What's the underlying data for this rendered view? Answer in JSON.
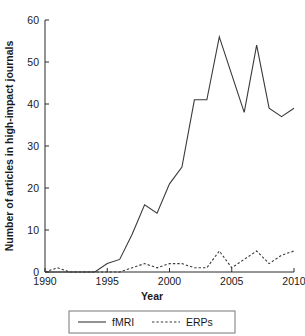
{
  "chart_data": {
    "type": "line",
    "title": "",
    "xlabel": "Year",
    "ylabel": "Number of articles in high-impact journals",
    "x": [
      1990,
      1991,
      1992,
      1993,
      1994,
      1995,
      1996,
      1997,
      1998,
      1999,
      2000,
      2001,
      2002,
      2003,
      2004,
      2005,
      2006,
      2007,
      2008,
      2009,
      2010
    ],
    "xlim": [
      1990,
      2010
    ],
    "ylim": [
      0,
      60
    ],
    "xticks": [
      1990,
      1995,
      2000,
      2005,
      2010
    ],
    "yticks": [
      0,
      10,
      20,
      30,
      40,
      50,
      60
    ],
    "xtick_labels": [
      "1990",
      "1995",
      "2000",
      "2005",
      "2010"
    ],
    "ytick_labels": [
      "0",
      "10",
      "20",
      "30",
      "40",
      "50",
      "60"
    ],
    "grid": false,
    "legend_position": "below",
    "series": [
      {
        "name": "fMRI",
        "style": "solid",
        "color": "#3a3a3a",
        "values": [
          0,
          0,
          0,
          0,
          0,
          2,
          3,
          9,
          16,
          14,
          21,
          25,
          41,
          41,
          56,
          47,
          38,
          54,
          39,
          37,
          39
        ]
      },
      {
        "name": "ERPs",
        "style": "dashed",
        "color": "#3a3a3a",
        "values": [
          0,
          1,
          0,
          0,
          0,
          0,
          0,
          1,
          2,
          1,
          2,
          2,
          1,
          1,
          5,
          1,
          3,
          5,
          2,
          4,
          5
        ]
      }
    ]
  },
  "axes": {
    "x_title": "Year",
    "y_title": "Number of articles in high-impact journals"
  },
  "legend": {
    "items": [
      {
        "label": "fMRI",
        "style": "solid"
      },
      {
        "label": "ERPs",
        "style": "dashed"
      }
    ]
  }
}
